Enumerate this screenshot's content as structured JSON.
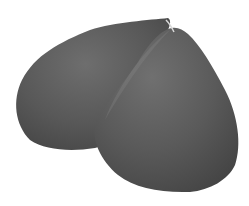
{
  "image": {
    "subject": "gray two-lobed 3D object",
    "background_color": "#ffffff",
    "colors": {
      "dark": "#4a4a4a",
      "mid": "#5e5e5e",
      "light": "#7a7a7a"
    }
  }
}
